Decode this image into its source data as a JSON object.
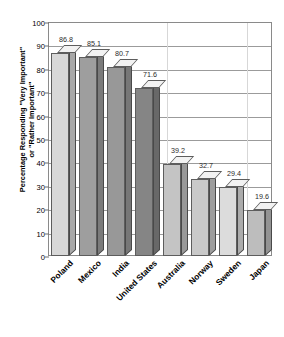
{
  "chart_data": {
    "type": "bar",
    "title": "Importance of God — Percentage by Country",
    "xlabel": "",
    "ylabel": "Percentage Responding \"Very Important\"\nor \"Rather Important\"",
    "categories": [
      "Poland",
      "Mexico",
      "India",
      "United States",
      "Australia",
      "Norway",
      "Sweden",
      "Japan"
    ],
    "values": [
      86.8,
      85.1,
      80.7,
      71.6,
      39.2,
      32.7,
      29.4,
      19.6
    ],
    "ylim": [
      0,
      100
    ],
    "yticks": [
      0,
      10,
      20,
      30,
      40,
      50,
      60,
      70,
      80,
      90,
      100
    ],
    "ytick_labels": [
      "0",
      "10",
      "20",
      "30",
      "40",
      "50",
      "60",
      "70",
      "80",
      "90",
      "100"
    ],
    "grid": true,
    "legend": false,
    "bar_colors": [
      "#d8d8d8",
      "#9e9e9e",
      "#989898",
      "#858585",
      "#c4c4c4",
      "#c9c9c9",
      "#dcdcdc",
      "#bdbdbd"
    ],
    "data_labels": [
      "86.8",
      "85.1",
      "80.7",
      "71.6",
      "39.2",
      "32.7",
      "29.4",
      "19.6"
    ]
  }
}
